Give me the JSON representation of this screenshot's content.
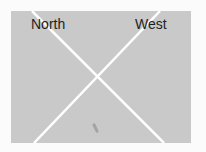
{
  "figure": {
    "labels": {
      "top_left": "North",
      "top_right": "West"
    },
    "colors": {
      "panel": "#c9c9c9",
      "lines": "#ffffff",
      "text": "#1e1e1e",
      "background": "#fbfbfb"
    }
  }
}
